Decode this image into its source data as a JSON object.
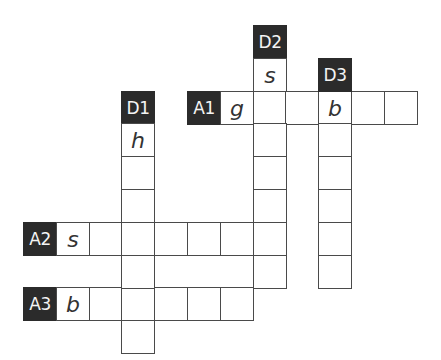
{
  "puzzle": {
    "type": "crossword",
    "cell_size": 32.8,
    "origin": {
      "x": 23,
      "y": 25
    },
    "colors": {
      "label_bg": "#2b2b2b",
      "label_text": "#f4f4f4",
      "border": "#4a4a4a",
      "letter": "#333333"
    },
    "clues": [
      {
        "id": "A1",
        "direction": "across",
        "label_pos": [
          5,
          2
        ],
        "length": 6,
        "given": {
          "0": "g",
          "3": "b"
        }
      },
      {
        "id": "A2",
        "direction": "across",
        "label_pos": [
          0,
          6
        ],
        "length": 7,
        "given": {
          "0": "s"
        }
      },
      {
        "id": "A3",
        "direction": "across",
        "label_pos": [
          0,
          8
        ],
        "length": 6,
        "given": {
          "0": "b"
        }
      },
      {
        "id": "D1",
        "direction": "down",
        "label_pos": [
          3,
          2
        ],
        "length": 7,
        "given": {
          "0": "h"
        }
      },
      {
        "id": "D2",
        "direction": "down",
        "label_pos": [
          7,
          0
        ],
        "length": 7,
        "given": {
          "0": "s"
        }
      },
      {
        "id": "D3",
        "direction": "down",
        "label_pos": [
          9,
          1
        ],
        "length": 6,
        "given": {
          "0": "b"
        }
      }
    ]
  }
}
